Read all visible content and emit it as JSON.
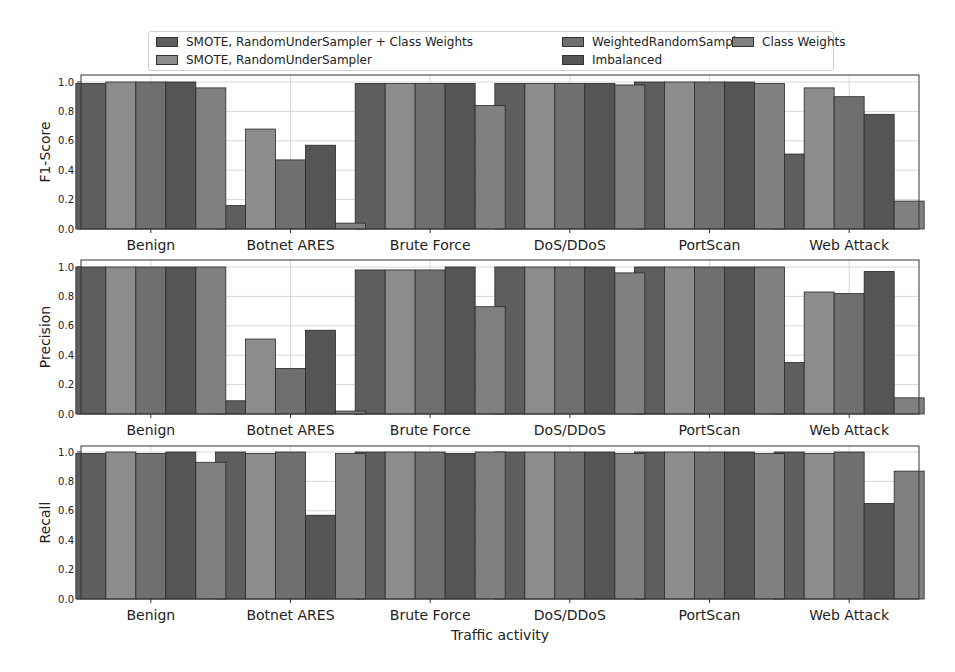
{
  "chart_data": {
    "type": "bar",
    "xlabel": "Traffic activity",
    "categories": [
      "Benign",
      "Botnet ARES",
      "Brute Force",
      "DoS/DDoS",
      "PortScan",
      "Web Attack"
    ],
    "series_names": [
      "SMOTE, RandomUnderSampler + Class Weights",
      "SMOTE, RandomUnderSampler",
      "WeightedRandomSampler",
      "Imbalanced",
      "Class Weights"
    ],
    "series_colors": [
      "#5e5e5e",
      "#8c8c8c",
      "#6f6f6f",
      "#555555",
      "#808080"
    ],
    "legend": {
      "placement": "top-center",
      "columns": 3
    },
    "grid": true,
    "panels": [
      {
        "ylabel": "F1-Score",
        "ylim": [
          0,
          1.05
        ],
        "yticks": [
          "0.0",
          "0.2",
          "0.4",
          "0.6",
          "0.8",
          "1.0"
        ],
        "series": [
          {
            "name": "SMOTE, RandomUnderSampler + Class Weights",
            "values": [
              0.99,
              0.16,
              0.99,
              0.99,
              1.0,
              0.51
            ]
          },
          {
            "name": "SMOTE, RandomUnderSampler",
            "values": [
              1.0,
              0.68,
              0.99,
              0.99,
              1.0,
              0.96
            ]
          },
          {
            "name": "WeightedRandomSampler",
            "values": [
              1.0,
              0.47,
              0.99,
              0.99,
              1.0,
              0.9
            ]
          },
          {
            "name": "Imbalanced",
            "values": [
              1.0,
              0.57,
              0.99,
              0.99,
              1.0,
              0.78
            ]
          },
          {
            "name": "Class Weights",
            "values": [
              0.96,
              0.04,
              0.84,
              0.98,
              0.99,
              0.19
            ]
          }
        ]
      },
      {
        "ylabel": "Precision",
        "ylim": [
          0,
          1.05
        ],
        "yticks": [
          "0.0",
          "0.2",
          "0.4",
          "0.6",
          "0.8",
          "1.0"
        ],
        "series": [
          {
            "name": "SMOTE, RandomUnderSampler + Class Weights",
            "values": [
              1.0,
              0.09,
              0.98,
              1.0,
              1.0,
              0.35
            ]
          },
          {
            "name": "SMOTE, RandomUnderSampler",
            "values": [
              1.0,
              0.51,
              0.98,
              1.0,
              1.0,
              0.83
            ]
          },
          {
            "name": "WeightedRandomSampler",
            "values": [
              1.0,
              0.31,
              0.98,
              1.0,
              1.0,
              0.82
            ]
          },
          {
            "name": "Imbalanced",
            "values": [
              1.0,
              0.57,
              1.0,
              1.0,
              1.0,
              0.97
            ]
          },
          {
            "name": "Class Weights",
            "values": [
              1.0,
              0.02,
              0.73,
              0.96,
              1.0,
              0.11
            ]
          }
        ]
      },
      {
        "ylabel": "Recall",
        "ylim": [
          0,
          1.05
        ],
        "yticks": [
          "0.0",
          "0.2",
          "0.4",
          "0.6",
          "0.8",
          "1.0"
        ],
        "series": [
          {
            "name": "SMOTE, RandomUnderSampler + Class Weights",
            "values": [
              0.99,
              1.0,
              1.0,
              1.0,
              1.0,
              1.0
            ]
          },
          {
            "name": "SMOTE, RandomUnderSampler",
            "values": [
              1.0,
              0.99,
              1.0,
              1.0,
              1.0,
              0.99
            ]
          },
          {
            "name": "WeightedRandomSampler",
            "values": [
              0.99,
              1.0,
              1.0,
              1.0,
              1.0,
              1.0
            ]
          },
          {
            "name": "Imbalanced",
            "values": [
              1.0,
              0.57,
              0.99,
              1.0,
              1.0,
              0.65
            ]
          },
          {
            "name": "Class Weights",
            "values": [
              0.93,
              0.99,
              1.0,
              0.99,
              0.99,
              0.87
            ]
          }
        ]
      }
    ]
  }
}
